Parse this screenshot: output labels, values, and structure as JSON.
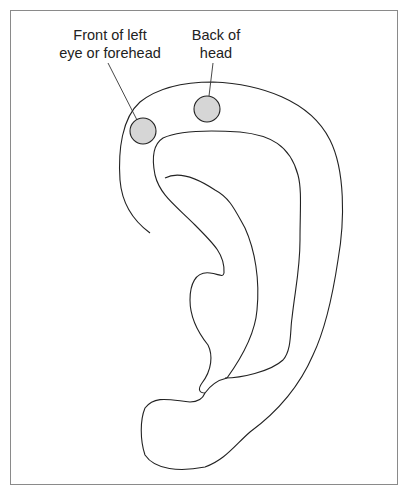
{
  "diagram": {
    "labels": {
      "front": {
        "line1": "Front of left",
        "line2": "eye or forehead"
      },
      "back": {
        "line1": "Back of",
        "line2": "head"
      }
    },
    "points": [
      {
        "name": "front-of-left-eye-or-forehead",
        "cx": 143,
        "cy": 131,
        "r": 13
      },
      {
        "name": "back-of-head",
        "cx": 207,
        "cy": 109,
        "r": 13
      }
    ],
    "colors": {
      "stroke": "#222222",
      "point_fill": "#d6d6d6",
      "frame": "#8a8a8a"
    }
  }
}
